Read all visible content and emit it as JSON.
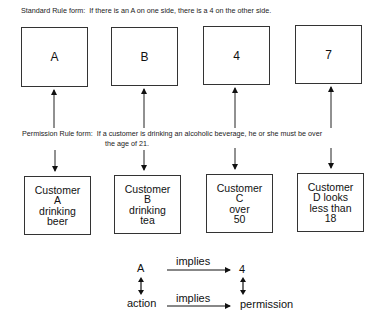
{
  "standard_rule": {
    "label": "Standard Rule form:",
    "text": "If there is an A on one side, there is a 4 on the other side."
  },
  "cards": [
    {
      "label": "A"
    },
    {
      "label": "B"
    },
    {
      "label": "4"
    },
    {
      "label": "7"
    }
  ],
  "permission_rule": {
    "label": "Permission Rule form:",
    "text_line1": "If a customer is drinking an alcoholic beverage, he or she must be over",
    "text_line2": "the age of 21."
  },
  "customers": [
    {
      "label": "Customer\nA\ndrinking\nbeer"
    },
    {
      "label": "Customer\nB\ndrinking\ntea"
    },
    {
      "label": "Customer\nC\nover\n50"
    },
    {
      "label": "Customer\nD looks\nless than\n18"
    }
  ],
  "mapping": {
    "top_left": "A",
    "top_arrow": "implies",
    "top_right": "4",
    "bottom_left": "action",
    "bottom_arrow": "implies",
    "bottom_right": "permission"
  }
}
